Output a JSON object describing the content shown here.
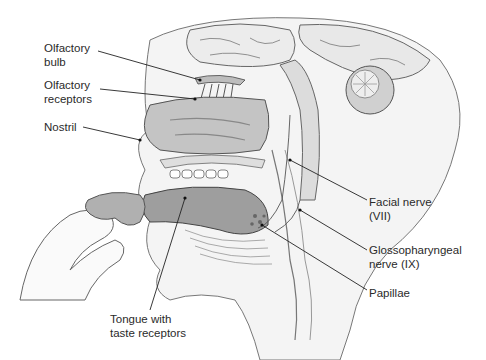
{
  "diagram": {
    "labels": [
      {
        "id": "olfactory-bulb",
        "lines": [
          "Olfactory",
          "bulb"
        ],
        "x": 44,
        "y": 41
      },
      {
        "id": "olfactory-receptors",
        "lines": [
          "Olfactory",
          "receptors"
        ],
        "x": 44,
        "y": 84
      },
      {
        "id": "nostril",
        "lines": [
          "Nostril"
        ],
        "x": 44,
        "y": 121
      },
      {
        "id": "facial-nerve",
        "lines": [
          "Facial nerve",
          "(VII)"
        ],
        "x": 369,
        "y": 196
      },
      {
        "id": "glossopharyngeal-nerve",
        "lines": [
          "Glossopharyngeal",
          "nerve (IX)"
        ],
        "x": 369,
        "y": 243
      },
      {
        "id": "papillae",
        "lines": [
          "Papillae"
        ],
        "x": 369,
        "y": 286
      },
      {
        "id": "tongue",
        "lines": [
          "Tongue with",
          "taste receptors"
        ],
        "x": 110,
        "y": 313
      }
    ],
    "colors": {
      "background": "#ffffff",
      "outline": "#555555",
      "tissue_light": "#e6e6e6",
      "tissue_mid": "#c8c8c8",
      "tissue_dark": "#9a9a9a",
      "leader_line": "#222222",
      "text": "#2a2a2a"
    }
  }
}
